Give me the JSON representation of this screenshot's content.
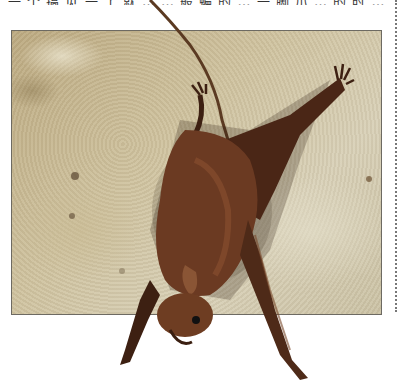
{
  "page": {
    "top_text_clipped": "一 个 搞 见 一 了 就 … … 般 蝙 的 … 一 脚 爪 … 的 时 …",
    "figure": {
      "subject": "bat hanging upside down on stone wall",
      "colors": {
        "wall_base": "#c9bc98",
        "wall_light": "#ddd6c0",
        "bat_fur": "#6b3a22",
        "bat_wing": "#3d2012",
        "frame_border": "#6d6a62",
        "margin_dots": "#777777"
      }
    }
  }
}
